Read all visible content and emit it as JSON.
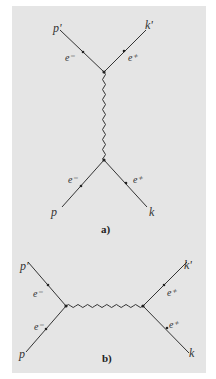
{
  "figure": {
    "background_color": "#e5e5e5",
    "line_color": "#333333",
    "diagram_a": {
      "caption": "a)",
      "labels": {
        "top_left_momentum": "p'",
        "top_right_momentum": "k'",
        "bottom_left_momentum": "p",
        "bottom_right_momentum": "k",
        "top_left_particle": "e⁻",
        "top_right_particle": "e⁺",
        "bottom_left_particle": "e⁻",
        "bottom_right_particle": "e⁺"
      },
      "propagator": "photon (wavy, vertical)"
    },
    "diagram_b": {
      "caption": "b)",
      "labels": {
        "top_left_momentum": "p'",
        "bottom_left_momentum": "p",
        "top_right_momentum": "k'",
        "bottom_right_momentum": "k",
        "top_left_particle": "e⁻",
        "bottom_left_particle": "e⁻",
        "top_right_particle": "e⁺",
        "bottom_right_particle": "e⁺"
      },
      "propagator": "photon (wavy, horizontal)"
    }
  }
}
